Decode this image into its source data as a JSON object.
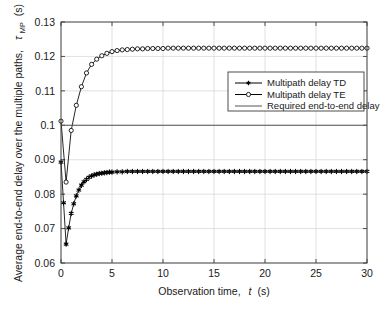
{
  "chart_data": {
    "type": "line",
    "title": "",
    "xlabel": "Observation time,  t (s)",
    "ylabel": "Average end-to-end delay over the multiple paths,  τMP (s)",
    "ylabel_main": "Average end-to-end delay over the multiple paths,",
    "ylabel_symbol": "τ",
    "ylabel_symbol_sub": "MP",
    "ylabel_units": "(s)",
    "xlabel_prefix": "Observation time,",
    "xlabel_var": "t",
    "xlabel_units": "(s)",
    "xlim": [
      0,
      30
    ],
    "ylim": [
      0.06,
      0.13
    ],
    "xticks": [
      0,
      5,
      10,
      15,
      20,
      25,
      30
    ],
    "xticklabels": [
      "0",
      "5",
      "10",
      "15",
      "20",
      "25",
      "30"
    ],
    "yticks": [
      0.06,
      0.07,
      0.08,
      0.09,
      0.1,
      0.11,
      0.12,
      0.13
    ],
    "yticklabels": [
      "0.06",
      "0.07",
      "0.08",
      "0.09",
      "0.1",
      "0.11",
      "0.12",
      "0.13"
    ],
    "grid": true,
    "legend_position": "upper right",
    "legend": [
      {
        "label": "Multipath delay TD",
        "marker": "filled-star",
        "line": "solid",
        "color": "#000000"
      },
      {
        "label": "Multipath delay TE",
        "marker": "open-circle",
        "line": "solid",
        "color": "#000000"
      },
      {
        "label": "Required end-to-end delay",
        "marker": "none",
        "line": "solid",
        "color": "#555555"
      }
    ],
    "series": [
      {
        "name": "Multipath delay TD",
        "marker": "filled-star",
        "color": "#000000",
        "x": [
          0,
          0.25,
          0.5,
          0.75,
          1,
          1.25,
          1.5,
          1.75,
          2,
          2.25,
          2.5,
          2.75,
          3,
          3.25,
          3.5,
          3.75,
          4,
          4.25,
          4.5,
          4.75,
          5,
          5.5,
          6,
          6.5,
          7,
          7.5,
          8,
          8.5,
          9,
          9.5,
          10,
          10.5,
          11,
          11.5,
          12,
          12.5,
          13,
          13.5,
          14,
          14.5,
          15,
          15.5,
          16,
          16.5,
          17,
          17.5,
          18,
          18.5,
          19,
          19.5,
          20,
          20.5,
          21,
          21.5,
          22,
          22.5,
          23,
          23.5,
          24,
          24.5,
          25,
          25.5,
          26,
          26.5,
          27,
          27.5,
          28,
          28.5,
          29,
          29.5,
          30
        ],
        "y": [
          0.0893,
          0.0775,
          0.0655,
          0.0702,
          0.0744,
          0.0772,
          0.0795,
          0.0812,
          0.0826,
          0.0836,
          0.0843,
          0.0849,
          0.0853,
          0.0856,
          0.0858,
          0.086,
          0.0861,
          0.0862,
          0.0863,
          0.0864,
          0.0864,
          0.0865,
          0.0865,
          0.0866,
          0.0866,
          0.0866,
          0.0866,
          0.0866,
          0.0866,
          0.0866,
          0.0866,
          0.0866,
          0.0866,
          0.0866,
          0.0866,
          0.0866,
          0.0866,
          0.0866,
          0.0866,
          0.0866,
          0.0866,
          0.0866,
          0.0866,
          0.0866,
          0.0866,
          0.0866,
          0.0866,
          0.0866,
          0.0866,
          0.0866,
          0.0866,
          0.0866,
          0.0866,
          0.0866,
          0.0866,
          0.0866,
          0.0866,
          0.0866,
          0.0866,
          0.0866,
          0.0866,
          0.0866,
          0.0866,
          0.0866,
          0.0866,
          0.0866,
          0.0866,
          0.0866,
          0.0866,
          0.0866,
          0.0866
        ]
      },
      {
        "name": "Multipath delay TE",
        "marker": "open-circle",
        "color": "#000000",
        "x": [
          0,
          0.5,
          1,
          1.5,
          2,
          2.5,
          3,
          3.5,
          4,
          4.5,
          5,
          5.5,
          6,
          6.5,
          7,
          7.5,
          8,
          8.5,
          9,
          9.5,
          10,
          10.5,
          11,
          11.5,
          12,
          12.5,
          13,
          13.5,
          14,
          14.5,
          15,
          15.5,
          16,
          16.5,
          17,
          17.5,
          18,
          18.5,
          19,
          19.5,
          20,
          20.5,
          21,
          21.5,
          22,
          22.5,
          23,
          23.5,
          24,
          24.5,
          25,
          25.5,
          26,
          26.5,
          27,
          27.5,
          28,
          28.5,
          29,
          29.5,
          30
        ],
        "y": [
          0.1012,
          0.0835,
          0.0985,
          0.1058,
          0.1112,
          0.1152,
          0.1177,
          0.1192,
          0.1202,
          0.1209,
          0.1214,
          0.1217,
          0.1219,
          0.122,
          0.1221,
          0.1222,
          0.1222,
          0.1223,
          0.1223,
          0.1223,
          0.1223,
          0.1224,
          0.1224,
          0.1224,
          0.1224,
          0.1224,
          0.1224,
          0.1224,
          0.1224,
          0.1224,
          0.1224,
          0.1224,
          0.1224,
          0.1224,
          0.1224,
          0.1224,
          0.1224,
          0.1224,
          0.1224,
          0.1224,
          0.1224,
          0.1224,
          0.1224,
          0.1224,
          0.1224,
          0.1224,
          0.1224,
          0.1224,
          0.1224,
          0.1224,
          0.1224,
          0.1224,
          0.1224,
          0.1224,
          0.1224,
          0.1224,
          0.1224,
          0.1224,
          0.1224,
          0.1224,
          0.1224
        ]
      },
      {
        "name": "Required end-to-end delay",
        "marker": "none",
        "color": "#555555",
        "x": [
          0,
          30
        ],
        "y": [
          0.1,
          0.1
        ]
      }
    ]
  }
}
